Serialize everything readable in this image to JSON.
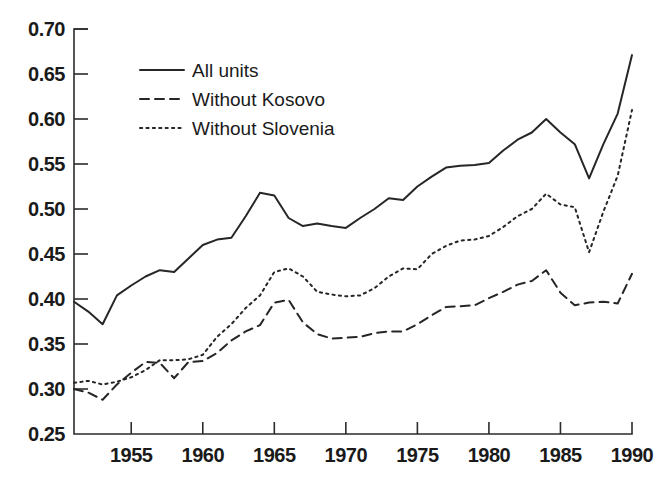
{
  "chart_data": {
    "type": "line",
    "title": "",
    "subtitle": "",
    "xlabel": "",
    "ylabel": "",
    "xlim": [
      1951,
      1990
    ],
    "ylim": [
      0.25,
      0.7
    ],
    "grid": false,
    "legend_position": "top-left",
    "x_ticks": [
      1955,
      1960,
      1965,
      1970,
      1975,
      1980,
      1985,
      1990
    ],
    "x_tick_labels": [
      "1955",
      "1960",
      "1965",
      "1970",
      "1975",
      "1980",
      "1985",
      "1990"
    ],
    "y_ticks": [
      0.25,
      0.3,
      0.35,
      0.4,
      0.45,
      0.5,
      0.55,
      0.6,
      0.65,
      0.7
    ],
    "y_tick_labels": [
      "0.25",
      "0.30",
      "0.35",
      "0.40",
      "0.45",
      "0.50",
      "0.55",
      "0.60",
      "0.65",
      "0.70"
    ],
    "x": [
      1951,
      1952,
      1953,
      1954,
      1955,
      1956,
      1957,
      1958,
      1959,
      1960,
      1961,
      1962,
      1963,
      1964,
      1965,
      1966,
      1967,
      1968,
      1969,
      1970,
      1971,
      1972,
      1973,
      1974,
      1975,
      1976,
      1977,
      1978,
      1979,
      1980,
      1981,
      1982,
      1983,
      1984,
      1985,
      1986,
      1987,
      1988,
      1989,
      1990
    ],
    "series": [
      {
        "name": "All units",
        "style": "solid",
        "color": "#262626",
        "values": [
          0.397,
          0.386,
          0.372,
          0.404,
          0.415,
          0.425,
          0.432,
          0.43,
          0.445,
          0.46,
          0.466,
          0.468,
          0.492,
          0.518,
          0.515,
          0.49,
          0.481,
          0.484,
          0.481,
          0.479,
          0.49,
          0.5,
          0.512,
          0.51,
          0.525,
          0.536,
          0.546,
          0.548,
          0.549,
          0.551,
          0.565,
          0.577,
          0.585,
          0.6,
          0.585,
          0.572,
          0.534,
          0.572,
          0.606,
          0.601
        ]
      },
      {
        "name": "Without Kosovo",
        "style": "dashed",
        "color": "#262626",
        "values": [
          0.3,
          0.296,
          0.288,
          0.305,
          0.318,
          0.33,
          0.329,
          0.312,
          0.33,
          0.331,
          0.34,
          0.354,
          0.364,
          0.371,
          0.396,
          0.399,
          0.374,
          0.361,
          0.356,
          0.357,
          0.358,
          0.362,
          0.364,
          0.364,
          0.372,
          0.382,
          0.391,
          0.392,
          0.393,
          0.401,
          0.408,
          0.416,
          0.42,
          0.432,
          0.407,
          0.393,
          0.396,
          0.397,
          0.395,
          0.397
        ]
      },
      {
        "name": "Without Slovenia",
        "style": "dotted",
        "color": "#262626",
        "values": [
          0.307,
          0.309,
          0.305,
          0.308,
          0.313,
          0.321,
          0.332,
          0.332,
          0.333,
          0.338,
          0.358,
          0.372,
          0.39,
          0.404,
          0.43,
          0.434,
          0.425,
          0.408,
          0.405,
          0.403,
          0.404,
          0.412,
          0.425,
          0.434,
          0.433,
          0.45,
          0.459,
          0.465,
          0.466,
          0.47,
          0.48,
          0.492,
          0.5,
          0.517,
          0.505,
          0.502,
          0.452,
          0.497,
          0.537,
          0.533
        ]
      }
    ],
    "series_tail": {
      "All units": {
        "1990": 0.671
      },
      "Without Kosovo": {
        "1990": 0.428
      },
      "Without Slovenia": {
        "1990": 0.61
      }
    }
  },
  "legend": {
    "items": [
      {
        "label": "All units",
        "style": "solid"
      },
      {
        "label": "Without Kosovo",
        "style": "dashed"
      },
      {
        "label": "Without Slovenia",
        "style": "dotted"
      }
    ]
  }
}
